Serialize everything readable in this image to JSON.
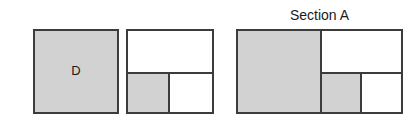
{
  "figure": {
    "caption": "Section A",
    "colors": {
      "fill_shaded": "#d2d2d2",
      "fill_empty": "#ffffff",
      "stroke": "#3c3c3c",
      "text": "#1a1a1a",
      "background": "#ffffff"
    },
    "shapes": [
      {
        "id": "figure-1",
        "name": "solid-square",
        "label": "D",
        "cells": [
          {
            "name": "whole",
            "fill": "shaded",
            "label": "D"
          }
        ]
      },
      {
        "id": "figure-2",
        "name": "quartered-square",
        "label": "",
        "cells": [
          {
            "name": "top-band",
            "fill": "empty",
            "label": ""
          },
          {
            "name": "bottom-left",
            "fill": "shaded",
            "label": ""
          },
          {
            "name": "bottom-right",
            "fill": "empty",
            "label": ""
          }
        ]
      },
      {
        "id": "figure-3",
        "name": "section-a-rectangle",
        "label": "Section A",
        "cells": [
          {
            "name": "left-column",
            "fill": "shaded",
            "label": ""
          },
          {
            "name": "top-right",
            "fill": "empty",
            "label": ""
          },
          {
            "name": "bottom-middle",
            "fill": "shaded",
            "label": ""
          },
          {
            "name": "bottom-right",
            "fill": "empty",
            "label": ""
          }
        ]
      }
    ]
  },
  "chart_data": {
    "type": "diagram",
    "title": "Section A",
    "figures": [
      {
        "index": 1,
        "label": "D",
        "outer_box": {
          "x": 33,
          "y": 29,
          "width": 86,
          "height": 85
        },
        "subdivisions": 1,
        "shaded_cells": 1,
        "cells": [
          {
            "region": "whole",
            "x": 0,
            "y": 0,
            "width": 86,
            "height": 85,
            "shaded": true,
            "label": "D"
          }
        ]
      },
      {
        "index": 2,
        "label": "",
        "outer_box": {
          "x": 126,
          "y": 29,
          "width": 88,
          "height": 85
        },
        "subdivisions": 3,
        "shaded_cells": 1,
        "dividers": {
          "horizontal_y": 41,
          "vertical_x": 40
        },
        "cells": [
          {
            "region": "top-band",
            "x": 0,
            "y": 0,
            "width": 88,
            "height": 41,
            "shaded": false,
            "label": ""
          },
          {
            "region": "bottom-left",
            "x": 0,
            "y": 43,
            "width": 40,
            "height": 38,
            "shaded": true,
            "label": ""
          },
          {
            "region": "bottom-right",
            "x": 42,
            "y": 43,
            "width": 44,
            "height": 38,
            "shaded": false,
            "label": ""
          }
        ]
      },
      {
        "index": 3,
        "label": "Section A",
        "outer_box": {
          "x": 236,
          "y": 29,
          "width": 167,
          "height": 85
        },
        "subdivisions": 4,
        "shaded_cells": 2,
        "dividers": {
          "vertical_main_x": 82,
          "horizontal_mid_y": 41,
          "vertical_sub_x": 122
        },
        "cells": [
          {
            "region": "left-column",
            "x": 0,
            "y": 0,
            "width": 82,
            "height": 81,
            "shaded": true,
            "label": ""
          },
          {
            "region": "top-right",
            "x": 84,
            "y": 0,
            "width": 81,
            "height": 41,
            "shaded": false,
            "label": ""
          },
          {
            "region": "bottom-middle",
            "x": 84,
            "y": 43,
            "width": 38,
            "height": 38,
            "shaded": true,
            "label": ""
          },
          {
            "region": "bottom-right",
            "x": 124,
            "y": 43,
            "width": 41,
            "height": 38,
            "shaded": false,
            "label": ""
          }
        ]
      }
    ]
  }
}
